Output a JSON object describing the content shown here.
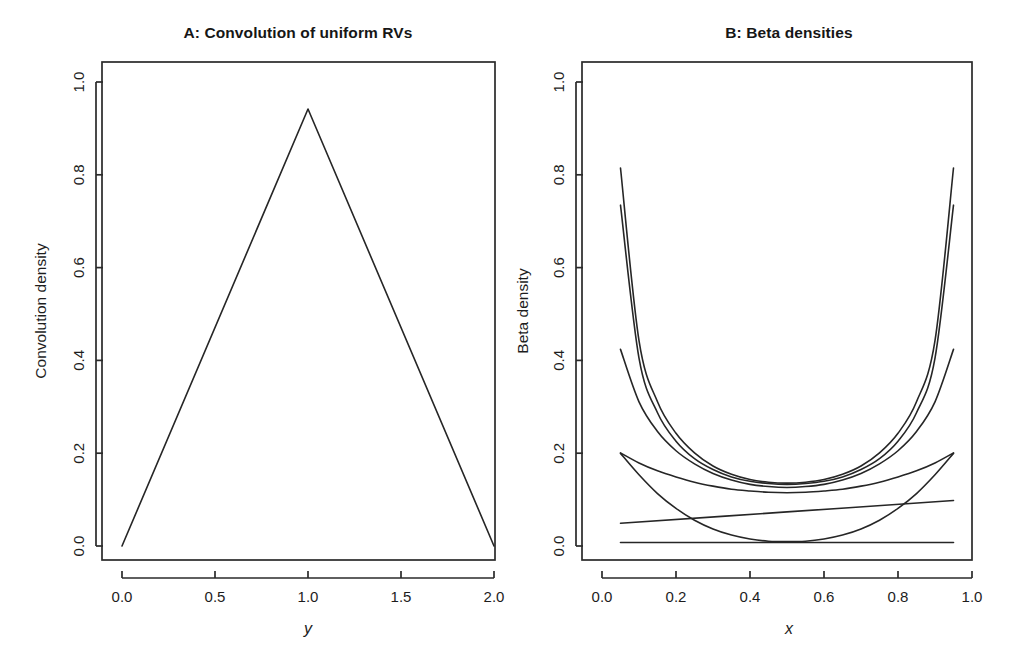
{
  "figure": {
    "width": 1013,
    "height": 658,
    "background": "#ffffff",
    "ink_color": "#262626",
    "panel_count": 2
  },
  "chart_data": [
    {
      "id": "panel-a",
      "type": "line",
      "title": "A: Convolution of uniform RVs",
      "xlabel": "y",
      "ylabel": "Convolution density",
      "xlim": [
        0.0,
        2.0
      ],
      "ylim": [
        0.0,
        1.05
      ],
      "grid": false,
      "legend": "none",
      "xticks": [
        0.0,
        0.5,
        1.0,
        1.5,
        2.0
      ],
      "xtick_labels": [
        "0.0",
        "0.5",
        "1.0",
        "1.5",
        "2.0"
      ],
      "yticks": [
        0.0,
        0.2,
        0.4,
        0.6,
        0.8,
        1.0
      ],
      "ytick_labels": [
        "0.0",
        "0.2",
        "0.4",
        "0.6",
        "0.8",
        "1.0"
      ],
      "series": [
        {
          "name": "triangular density (sum of two U(0,1))",
          "x": [
            0.0,
            1.0,
            2.0
          ],
          "y": [
            0.0,
            1.0,
            0.0
          ]
        }
      ]
    },
    {
      "id": "panel-b",
      "type": "line",
      "title": "B: Beta densities",
      "xlabel": "x",
      "ylabel": "Beta density",
      "xlim": [
        0.0,
        1.0
      ],
      "ylim": [
        0.0,
        1.05
      ],
      "grid": false,
      "legend": "none",
      "xticks": [
        0.0,
        0.2,
        0.4,
        0.6,
        0.8,
        1.0
      ],
      "xtick_labels": [
        "0.0",
        "0.2",
        "0.4",
        "0.6",
        "0.8",
        "1.0"
      ],
      "yticks": [
        0.0,
        0.2,
        0.4,
        0.6,
        0.8,
        1.0
      ],
      "ytick_labels": [
        "0.0",
        "0.2",
        "0.4",
        "0.6",
        "0.8",
        "1.0"
      ],
      "x_domain_drawn": [
        0.05,
        0.95
      ],
      "series": [
        {
          "name": "beta-curve-1-steep-u",
          "x": [
            0.05,
            0.1,
            0.15,
            0.2,
            0.25,
            0.3,
            0.35,
            0.4,
            0.45,
            0.5,
            0.55,
            0.6,
            0.65,
            0.7,
            0.75,
            0.8,
            0.85,
            0.9,
            0.95
          ],
          "y": [
            0.865,
            0.47,
            0.33,
            0.258,
            0.213,
            0.183,
            0.164,
            0.152,
            0.146,
            0.144,
            0.146,
            0.152,
            0.164,
            0.183,
            0.213,
            0.258,
            0.33,
            0.47,
            0.865
          ]
        },
        {
          "name": "beta-curve-2-steep-u",
          "x": [
            0.05,
            0.1,
            0.15,
            0.2,
            0.25,
            0.3,
            0.35,
            0.4,
            0.45,
            0.5,
            0.55,
            0.6,
            0.65,
            0.7,
            0.75,
            0.8,
            0.85,
            0.9,
            0.95
          ],
          "y": [
            0.78,
            0.43,
            0.305,
            0.24,
            0.2,
            0.175,
            0.158,
            0.148,
            0.143,
            0.141,
            0.143,
            0.148,
            0.158,
            0.175,
            0.2,
            0.24,
            0.305,
            0.43,
            0.78
          ]
        },
        {
          "name": "beta-curve-3-moderate-u",
          "x": [
            0.05,
            0.1,
            0.15,
            0.2,
            0.25,
            0.3,
            0.35,
            0.4,
            0.45,
            0.5,
            0.55,
            0.6,
            0.65,
            0.7,
            0.75,
            0.8,
            0.85,
            0.9,
            0.95
          ],
          "y": [
            0.45,
            0.33,
            0.262,
            0.218,
            0.188,
            0.166,
            0.151,
            0.141,
            0.136,
            0.134,
            0.136,
            0.141,
            0.151,
            0.166,
            0.188,
            0.218,
            0.262,
            0.33,
            0.45
          ]
        },
        {
          "name": "beta-curve-4-shallow-u",
          "x": [
            0.05,
            0.1,
            0.15,
            0.2,
            0.25,
            0.3,
            0.35,
            0.4,
            0.45,
            0.5,
            0.55,
            0.6,
            0.65,
            0.7,
            0.75,
            0.8,
            0.85,
            0.9,
            0.95
          ],
          "y": [
            0.213,
            0.19,
            0.172,
            0.158,
            0.146,
            0.137,
            0.13,
            0.126,
            0.123,
            0.122,
            0.123,
            0.126,
            0.13,
            0.137,
            0.146,
            0.158,
            0.172,
            0.19,
            0.213
          ]
        },
        {
          "name": "beta-curve-5-deep-u",
          "x": [
            0.05,
            0.1,
            0.15,
            0.2,
            0.25,
            0.3,
            0.35,
            0.4,
            0.45,
            0.5,
            0.55,
            0.6,
            0.65,
            0.7,
            0.75,
            0.8,
            0.85,
            0.9,
            0.95
          ],
          "y": [
            0.212,
            0.163,
            0.12,
            0.086,
            0.059,
            0.039,
            0.025,
            0.016,
            0.011,
            0.01,
            0.011,
            0.016,
            0.025,
            0.039,
            0.059,
            0.086,
            0.12,
            0.163,
            0.212
          ]
        },
        {
          "name": "beta-curve-6-gentle-decreasing-line",
          "x": [
            0.05,
            0.5,
            0.95
          ],
          "y": [
            0.052,
            0.078,
            0.104
          ]
        },
        {
          "name": "beta-curve-7-flat-uniform",
          "x": [
            0.05,
            0.5,
            0.95
          ],
          "y": [
            0.008,
            0.008,
            0.008
          ]
        }
      ]
    }
  ]
}
